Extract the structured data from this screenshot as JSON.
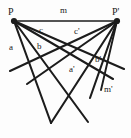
{
  "figure": {
    "kind": "geometry-diagram",
    "stroke_color": "#1c1c1c",
    "background_color": "#fdfdfd",
    "width": 131,
    "height": 138,
    "points": [
      {
        "id": "P",
        "label": "P",
        "x": 14,
        "y": 21
      },
      {
        "id": "Pp",
        "label": "P'",
        "x": 117,
        "y": 21
      }
    ],
    "labels": [
      {
        "id": "label-P",
        "text": "P",
        "x": 8,
        "y": 7
      },
      {
        "id": "label-Pprime",
        "text": "P'",
        "x": 112,
        "y": 7
      },
      {
        "id": "label-m",
        "text": "m",
        "x": 60,
        "y": 6
      },
      {
        "id": "label-c",
        "text": "c",
        "x": 39,
        "y": 26
      },
      {
        "id": "label-cprime",
        "text": "c'",
        "x": 74,
        "y": 27
      },
      {
        "id": "label-a",
        "text": "a",
        "x": 9,
        "y": 43
      },
      {
        "id": "label-b",
        "text": "b",
        "x": 37,
        "y": 42
      },
      {
        "id": "label-aprime",
        "text": "a'",
        "x": 69,
        "y": 65
      },
      {
        "id": "label-bprime",
        "text": "b'",
        "x": 95,
        "y": 55
      },
      {
        "id": "label-mprime",
        "text": "m'",
        "x": 104,
        "y": 85
      }
    ],
    "segments": [
      {
        "id": "seg-m",
        "name": "baseline-m",
        "x1": 14,
        "y1": 21,
        "x2": 117,
        "y2": 21,
        "w": 1.6
      },
      {
        "id": "seg-a",
        "name": "ray-a",
        "x1": 14,
        "y1": 21,
        "x2": 51,
        "y2": 123,
        "w": 2.1
      },
      {
        "id": "seg-b",
        "name": "ray-b",
        "x1": 14,
        "y1": 21,
        "x2": 88,
        "y2": 122,
        "w": 2.1
      },
      {
        "id": "seg-c",
        "name": "ray-c",
        "x1": 14,
        "y1": 21,
        "x2": 113,
        "y2": 79,
        "w": 2.1
      },
      {
        "id": "seg-d",
        "name": "ray-p-extra",
        "x1": 14,
        "y1": 21,
        "x2": 124,
        "y2": 69,
        "w": 2.1
      },
      {
        "id": "seg-ap",
        "name": "ray-a-prime",
        "x1": 117,
        "y1": 21,
        "x2": 51,
        "y2": 123,
        "w": 2.1
      },
      {
        "id": "seg-bp",
        "name": "ray-b-prime",
        "x1": 117,
        "y1": 21,
        "x2": 90,
        "y2": 98,
        "w": 2.1
      },
      {
        "id": "seg-cp",
        "name": "ray-c-prime",
        "x1": 117,
        "y1": 21,
        "x2": 27,
        "y2": 84,
        "w": 2.1
      },
      {
        "id": "seg-dp",
        "name": "ray-pp-extra",
        "x1": 117,
        "y1": 21,
        "x2": 10,
        "y2": 71,
        "w": 2.1
      },
      {
        "id": "seg-mp",
        "name": "line-m-prime",
        "x1": 117,
        "y1": 21,
        "x2": 101,
        "y2": 90,
        "w": 1.9
      }
    ]
  }
}
